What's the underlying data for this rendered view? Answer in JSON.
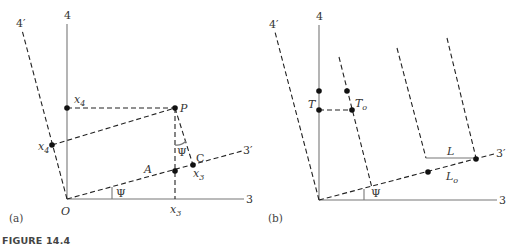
{
  "figure": {
    "caption": "FIGURE 14.4",
    "panel_a": {
      "label": "(a)",
      "axis_4": "4",
      "axis_3": "3",
      "axis_4_prime": "4′",
      "axis_3_prime": "3′",
      "origin": "O",
      "point_x4": "x",
      "point_x4_sub": "4",
      "point_x4p": "x",
      "point_x4p_sub": "4",
      "point_P": "P",
      "point_A": "A",
      "point_C": "C",
      "point_x3p": "x",
      "point_x3p_sub": "3",
      "point_x3": "x",
      "point_x3_sub": "3",
      "angle_psi_1": "Ψ",
      "angle_psi_2": "Ψ"
    },
    "panel_b": {
      "label": "(b)",
      "axis_4": "4",
      "axis_3": "3",
      "axis_4_prime": "4′",
      "axis_3_prime": "3′",
      "point_T": "T",
      "point_To": "T",
      "point_To_sub": "o",
      "point_L": "L",
      "point_Lo": "L",
      "point_Lo_sub": "o",
      "angle_psi": "Ψ"
    }
  }
}
